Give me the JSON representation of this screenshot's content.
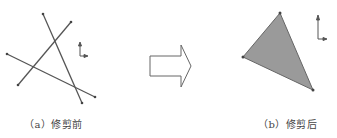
{
  "panels": {
    "left": {
      "caption": "（a）修剪前",
      "lines": [
        {
          "x1": 43,
          "y1": 14,
          "x2": 82,
          "y2": 103
        },
        {
          "x1": 71,
          "y1": 22,
          "x2": 18,
          "y2": 85
        },
        {
          "x1": 7,
          "y1": 54,
          "x2": 95,
          "y2": 97
        }
      ]
    },
    "right": {
      "caption": "（b）修剪后",
      "triangle": [
        [
          280,
          13
        ],
        [
          243,
          57
        ],
        [
          313,
          90
        ]
      ]
    }
  },
  "colors": {
    "line": "#555555",
    "fill": "#9a9a9a",
    "arrow_stroke": "#666666",
    "axis": "#555555"
  },
  "icons": {
    "arrow": "right-block-arrow-icon",
    "axis": "coordinate-axis-icon"
  }
}
